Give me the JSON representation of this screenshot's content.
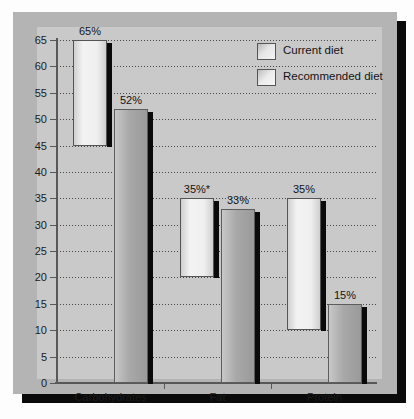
{
  "chart_data": {
    "type": "bar",
    "title": "",
    "subtitle": "",
    "xlabel": "",
    "ylabel": "",
    "ylim": [
      0,
      65
    ],
    "ytick_interval": 5,
    "yticks": [
      0,
      5,
      10,
      15,
      20,
      25,
      30,
      35,
      40,
      45,
      50,
      55,
      60,
      65
    ],
    "grid": true,
    "grid_axis": "y",
    "legend_position": "top-right",
    "categories": [
      "Carbohydrates",
      "Fat",
      "Protein"
    ],
    "note": "Current diet bars are floating range bars (low-to-high); recommended diet bars start at zero.",
    "series": [
      {
        "name": "Current diet",
        "style": "floating-range",
        "values": [
          65,
          35,
          35
        ],
        "bases": [
          45,
          20,
          10
        ],
        "labels": [
          "65%",
          "35%*",
          "35%"
        ]
      },
      {
        "name": "Recommended diet",
        "style": "from-zero",
        "values": [
          52,
          33,
          15
        ],
        "bases": [
          0,
          0,
          0
        ],
        "labels": [
          "52%",
          "33%",
          "15%"
        ]
      }
    ],
    "annotations": [
      "*"
    ],
    "colors": {
      "current_diet": "#eeeeee",
      "recommended_diet": "#a4a4a4",
      "bar_shadow": "#0a0a0a",
      "frame": "#b4b4b4",
      "panel": "#c9c9c9",
      "axis": "#585858",
      "gridline": "#4a4a4a",
      "text": "#141414"
    }
  },
  "legend": {
    "items": [
      {
        "label": "Current diet",
        "swatch": "swatch-current-diet"
      },
      {
        "label": "Recommended diet",
        "swatch": "swatch-recommended-diet"
      }
    ]
  },
  "axes": {
    "y": {
      "ticks": [
        {
          "value": 65,
          "label": "65"
        },
        {
          "value": 60,
          "label": "60"
        },
        {
          "value": 55,
          "label": "55"
        },
        {
          "value": 50,
          "label": "50"
        },
        {
          "value": 45,
          "label": "45"
        },
        {
          "value": 40,
          "label": "40"
        },
        {
          "value": 35,
          "label": "35"
        },
        {
          "value": 30,
          "label": "30"
        },
        {
          "value": 25,
          "label": "25"
        },
        {
          "value": 20,
          "label": "20"
        },
        {
          "value": 15,
          "label": "15"
        },
        {
          "value": 10,
          "label": "10"
        },
        {
          "value": 5,
          "label": "5"
        },
        {
          "value": 0,
          "label": "0"
        }
      ]
    },
    "x": {
      "ticks": [
        {
          "label": "Carbohydrates"
        },
        {
          "label": "Fat"
        },
        {
          "label": "Protein"
        }
      ]
    }
  }
}
